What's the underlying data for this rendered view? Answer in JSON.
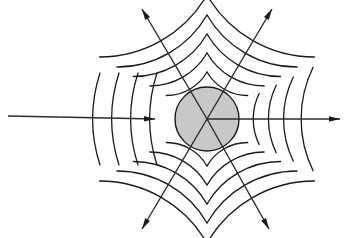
{
  "figure": {
    "background_color": "#ffffff",
    "width": 348,
    "height": 238
  },
  "scatterer": {
    "name": "circular scatterer",
    "center_x": 207,
    "center_y": 119,
    "radius": 32,
    "fill_color": "#c8c8c8",
    "stroke_color": "#1a1a1a",
    "stroke_width": 1.4
  },
  "style": {
    "arc_stroke_color": "#1a1a1a",
    "arc_stroke_width": 1.3,
    "ray_stroke_color": "#2b2b2b",
    "ray_stroke_width": 1.4,
    "arrow_fill_color": "#1a1a1a"
  },
  "chart_data": {
    "type": "diagram",
    "center": [
      207,
      119
    ],
    "scatterer_radius": 32,
    "incident_wave": {
      "label": "incident plane wave",
      "direction_degrees": 0,
      "arc_count": 4,
      "arc_curvature_radius": 150,
      "arc_x_positions": [
        100,
        119,
        138,
        157
      ],
      "arc_half_height": 46
    },
    "scattered_sectors": [
      {
        "label": "forward scattered",
        "angle_degrees": 0,
        "arc_count": 4,
        "arc_radii": [
          58,
          77,
          96,
          118
        ],
        "angular_half_width_degrees": 26
      },
      {
        "label": "upper-left scattered",
        "angle_degrees": 120,
        "arc_count": 5,
        "arc_radii": [
          47,
          66,
          85,
          104,
          124
        ],
        "angular_half_width_degrees": 30
      },
      {
        "label": "upper-right scattered",
        "angle_degrees": 60,
        "arc_count": 5,
        "arc_radii": [
          47,
          66,
          85,
          104,
          124
        ],
        "angular_half_width_degrees": 30
      },
      {
        "label": "lower-left scattered",
        "angle_degrees": 240,
        "arc_count": 5,
        "arc_radii": [
          47,
          66,
          85,
          104,
          124
        ],
        "angular_half_width_degrees": 30
      },
      {
        "label": "lower-right scattered",
        "angle_degrees": 300,
        "arc_count": 5,
        "arc_radii": [
          47,
          66,
          85,
          104,
          124
        ],
        "angular_half_width_degrees": 30
      }
    ],
    "rays": [
      {
        "label": "incident ray",
        "x1": 8,
        "y1": 116,
        "x2": 155,
        "y2": 119,
        "arrow_at_end": true
      },
      {
        "label": "forward transmitted ray",
        "x1": 207,
        "y1": 119,
        "x2": 340,
        "y2": 119,
        "arrow_at_end": true
      },
      {
        "label": "upper-left scattered ray",
        "x1": 207,
        "y1": 119,
        "x2": 142,
        "y2": 9,
        "arrow_at_end": true
      },
      {
        "label": "upper-right scattered ray",
        "x1": 207,
        "y1": 119,
        "x2": 272,
        "y2": 9,
        "arrow_at_end": true
      },
      {
        "label": "lower-left scattered ray",
        "x1": 207,
        "y1": 119,
        "x2": 142,
        "y2": 229,
        "arrow_at_end": true
      },
      {
        "label": "lower-right scattered ray",
        "x1": 207,
        "y1": 119,
        "x2": 269,
        "y2": 229,
        "arrow_at_end": true
      }
    ],
    "grid": false,
    "legend": null,
    "xlabel": "",
    "ylabel": ""
  }
}
